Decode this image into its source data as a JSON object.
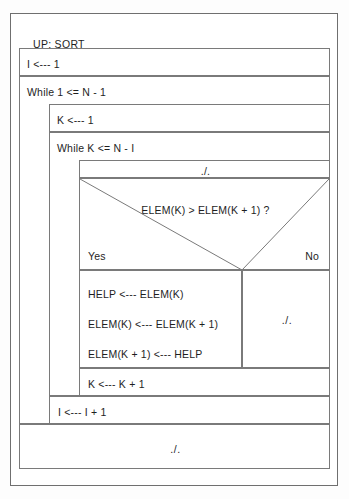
{
  "diagram": {
    "type": "nassi-shneiderman-structogram",
    "title": "UP: SORT",
    "algorithm": "bubble sort",
    "background_color": "#fdfdfd",
    "line_color": "#7a7a7a",
    "text_color": "#1e1e1e"
  },
  "blocks": {
    "init_i": "I <--- 1",
    "while_outer": "While 1 <= N - 1",
    "init_k": "K <--- 1",
    "while_inner": "While K <= N - I",
    "inner_top_marker": "./.",
    "condition": "ELEM(K) > ELEM(K + 1) ?",
    "branch_yes_label": "Yes",
    "branch_no_label": "No",
    "yes_statements": [
      "HELP <--- ELEM(K)",
      "ELEM(K) <--- ELEM(K + 1)",
      "ELEM(K + 1) <--- HELP"
    ],
    "no_statement": "./.",
    "increment_k": "K <--- K + 1",
    "increment_i": "I <--- I + 1",
    "end_marker": "./."
  }
}
